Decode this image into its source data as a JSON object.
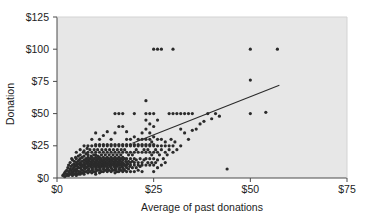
{
  "chart_data": {
    "type": "scatter",
    "title": "",
    "xlabel": "Average of past donations",
    "ylabel": "Donation",
    "xlim": [
      0,
      75
    ],
    "ylim": [
      0,
      125
    ],
    "xticks": [
      0,
      25,
      50,
      75
    ],
    "yticks": [
      0,
      25,
      50,
      75,
      100,
      125
    ],
    "xtick_labels": [
      "$0",
      "$25",
      "$50",
      "$75"
    ],
    "ytick_labels": [
      "$0",
      "$25",
      "$50",
      "$75",
      "$100",
      "$125"
    ],
    "grid": false,
    "legend": null,
    "marker_color": "#2b2b2b",
    "marker_size": 1.6,
    "plot_background": "#e7e7e7",
    "frame_color": "#4a4a4a",
    "trendline": {
      "label": "regression line",
      "color": "#2b2b2b",
      "x_start": 19.5,
      "y_start": 27.0,
      "x_end": 57.5,
      "y_end": 72.0
    },
    "points": [
      [
        1.5,
        2
      ],
      [
        1.8,
        3
      ],
      [
        2,
        1
      ],
      [
        2,
        4
      ],
      [
        2.2,
        5
      ],
      [
        2.5,
        2
      ],
      [
        2.5,
        6
      ],
      [
        2.6,
        3
      ],
      [
        2.8,
        8
      ],
      [
        3,
        2
      ],
      [
        3,
        5
      ],
      [
        3,
        10
      ],
      [
        3.2,
        4
      ],
      [
        3.3,
        7
      ],
      [
        3.4,
        12
      ],
      [
        3.5,
        3
      ],
      [
        3.5,
        6
      ],
      [
        3.6,
        9
      ],
      [
        3.8,
        5
      ],
      [
        3.8,
        15
      ],
      [
        4,
        2
      ],
      [
        4,
        4
      ],
      [
        4,
        7
      ],
      [
        4,
        10
      ],
      [
        4,
        14
      ],
      [
        4.2,
        5
      ],
      [
        4.3,
        8
      ],
      [
        4.4,
        11
      ],
      [
        4.5,
        3
      ],
      [
        4.5,
        6
      ],
      [
        4.5,
        13
      ],
      [
        4.6,
        9
      ],
      [
        4.8,
        5
      ],
      [
        4.8,
        16
      ],
      [
        5,
        2
      ],
      [
        5,
        4
      ],
      [
        5,
        7
      ],
      [
        5,
        10
      ],
      [
        5,
        12
      ],
      [
        5,
        15
      ],
      [
        5,
        20
      ],
      [
        5.2,
        6
      ],
      [
        5.3,
        9
      ],
      [
        5.4,
        13
      ],
      [
        5.5,
        3
      ],
      [
        5.5,
        8
      ],
      [
        5.5,
        11
      ],
      [
        5.5,
        17
      ],
      [
        5.6,
        5
      ],
      [
        5.8,
        14
      ],
      [
        6,
        3
      ],
      [
        6,
        5
      ],
      [
        6,
        8
      ],
      [
        6,
        10
      ],
      [
        6,
        12
      ],
      [
        6,
        15
      ],
      [
        6,
        18
      ],
      [
        6,
        22
      ],
      [
        6.2,
        7
      ],
      [
        6.3,
        11
      ],
      [
        6.4,
        9
      ],
      [
        6.5,
        4
      ],
      [
        6.5,
        13
      ],
      [
        6.5,
        16
      ],
      [
        6.6,
        6
      ],
      [
        6.8,
        10
      ],
      [
        6.8,
        20
      ],
      [
        7,
        3
      ],
      [
        7,
        5
      ],
      [
        7,
        8
      ],
      [
        7,
        10
      ],
      [
        7,
        12
      ],
      [
        7,
        14
      ],
      [
        7,
        17
      ],
      [
        7,
        21
      ],
      [
        7,
        25
      ],
      [
        7.2,
        7
      ],
      [
        7.3,
        9
      ],
      [
        7.4,
        11
      ],
      [
        7.5,
        5
      ],
      [
        7.5,
        13
      ],
      [
        7.5,
        15
      ],
      [
        7.5,
        19
      ],
      [
        7.6,
        8
      ],
      [
        7.8,
        12
      ],
      [
        7.8,
        23
      ],
      [
        8,
        4
      ],
      [
        8,
        6
      ],
      [
        8,
        9
      ],
      [
        8,
        10
      ],
      [
        8,
        12
      ],
      [
        8,
        14
      ],
      [
        8,
        16
      ],
      [
        8,
        18
      ],
      [
        8,
        20
      ],
      [
        8,
        25
      ],
      [
        8.2,
        7
      ],
      [
        8.3,
        11
      ],
      [
        8.4,
        13
      ],
      [
        8.5,
        5
      ],
      [
        8.5,
        10
      ],
      [
        8.5,
        15
      ],
      [
        8.5,
        22
      ],
      [
        8.6,
        9
      ],
      [
        8.8,
        12
      ],
      [
        8.8,
        17
      ],
      [
        9,
        4
      ],
      [
        9,
        6
      ],
      [
        9,
        8
      ],
      [
        9,
        10
      ],
      [
        9,
        12
      ],
      [
        9,
        14
      ],
      [
        9,
        16
      ],
      [
        9,
        20
      ],
      [
        9,
        25
      ],
      [
        9,
        30
      ],
      [
        9.2,
        7
      ],
      [
        9.3,
        11
      ],
      [
        9.4,
        13
      ],
      [
        9.5,
        5
      ],
      [
        9.5,
        9
      ],
      [
        9.5,
        15
      ],
      [
        9.5,
        18
      ],
      [
        9.6,
        22
      ],
      [
        9.8,
        10
      ],
      [
        9.8,
        12
      ],
      [
        10,
        3
      ],
      [
        10,
        5
      ],
      [
        10,
        7
      ],
      [
        10,
        9
      ],
      [
        10,
        10
      ],
      [
        10,
        12
      ],
      [
        10,
        14
      ],
      [
        10,
        16
      ],
      [
        10,
        18
      ],
      [
        10,
        20
      ],
      [
        10,
        25
      ],
      [
        10,
        26
      ],
      [
        10,
        35
      ],
      [
        10.2,
        8
      ],
      [
        10.3,
        11
      ],
      [
        10.4,
        13
      ],
      [
        10.5,
        6
      ],
      [
        10.5,
        10
      ],
      [
        10.5,
        15
      ],
      [
        10.5,
        22
      ],
      [
        10.6,
        17
      ],
      [
        10.8,
        9
      ],
      [
        10.8,
        12
      ],
      [
        11,
        4
      ],
      [
        11,
        6
      ],
      [
        11,
        8
      ],
      [
        11,
        10
      ],
      [
        11,
        12
      ],
      [
        11,
        14
      ],
      [
        11,
        16
      ],
      [
        11,
        20
      ],
      [
        11,
        25
      ],
      [
        11,
        26
      ],
      [
        11,
        30
      ],
      [
        11.2,
        7
      ],
      [
        11.3,
        11
      ],
      [
        11.4,
        15
      ],
      [
        11.5,
        5
      ],
      [
        11.5,
        9
      ],
      [
        11.5,
        13
      ],
      [
        11.5,
        18
      ],
      [
        11.6,
        22
      ],
      [
        11.8,
        10
      ],
      [
        11.8,
        12
      ],
      [
        12,
        5
      ],
      [
        12,
        7
      ],
      [
        12,
        9
      ],
      [
        12,
        10
      ],
      [
        12,
        12
      ],
      [
        12,
        14
      ],
      [
        12,
        16
      ],
      [
        12,
        20
      ],
      [
        12,
        25
      ],
      [
        12,
        26
      ],
      [
        12,
        33
      ],
      [
        12.2,
        8
      ],
      [
        12.3,
        11
      ],
      [
        12.4,
        13
      ],
      [
        12.5,
        6
      ],
      [
        12.5,
        10
      ],
      [
        12.5,
        15
      ],
      [
        12.5,
        18
      ],
      [
        12.6,
        22
      ],
      [
        12.8,
        9
      ],
      [
        12.8,
        12
      ],
      [
        13,
        5
      ],
      [
        13,
        7
      ],
      [
        13,
        10
      ],
      [
        13,
        12
      ],
      [
        13,
        14
      ],
      [
        13,
        16
      ],
      [
        13,
        20
      ],
      [
        13,
        25
      ],
      [
        13,
        26
      ],
      [
        13,
        36
      ],
      [
        13.2,
        8
      ],
      [
        13.3,
        11
      ],
      [
        13.4,
        15
      ],
      [
        13.5,
        6
      ],
      [
        13.5,
        10
      ],
      [
        13.5,
        13
      ],
      [
        13.5,
        18
      ],
      [
        13.6,
        22
      ],
      [
        13.8,
        9
      ],
      [
        13.8,
        12
      ],
      [
        14,
        5
      ],
      [
        14,
        8
      ],
      [
        14,
        10
      ],
      [
        14,
        12
      ],
      [
        14,
        14
      ],
      [
        14,
        16
      ],
      [
        14,
        20
      ],
      [
        14,
        25
      ],
      [
        14,
        26
      ],
      [
        14,
        30
      ],
      [
        14.2,
        7
      ],
      [
        14.3,
        11
      ],
      [
        14.4,
        13
      ],
      [
        14.5,
        6
      ],
      [
        14.5,
        10
      ],
      [
        14.5,
        15
      ],
      [
        14.5,
        18
      ],
      [
        14.6,
        22
      ],
      [
        14.8,
        9
      ],
      [
        14.8,
        12
      ],
      [
        15,
        4
      ],
      [
        15,
        6
      ],
      [
        15,
        8
      ],
      [
        15,
        10
      ],
      [
        15,
        12
      ],
      [
        15,
        14
      ],
      [
        15,
        16
      ],
      [
        15,
        20
      ],
      [
        15,
        25
      ],
      [
        15,
        26
      ],
      [
        15,
        35
      ],
      [
        15,
        50
      ],
      [
        15.2,
        7
      ],
      [
        15.3,
        11
      ],
      [
        15.4,
        13
      ],
      [
        15.5,
        5
      ],
      [
        15.5,
        9
      ],
      [
        15.5,
        15
      ],
      [
        15.5,
        18
      ],
      [
        15.6,
        22
      ],
      [
        15.8,
        10
      ],
      [
        15.8,
        12
      ],
      [
        16,
        5
      ],
      [
        16,
        7
      ],
      [
        16,
        10
      ],
      [
        16,
        12
      ],
      [
        16,
        14
      ],
      [
        16,
        16
      ],
      [
        16,
        20
      ],
      [
        16,
        25
      ],
      [
        16,
        26
      ],
      [
        16,
        40
      ],
      [
        16,
        50
      ],
      [
        16.2,
        8
      ],
      [
        16.3,
        11
      ],
      [
        16.4,
        13
      ],
      [
        16.5,
        6
      ],
      [
        16.5,
        10
      ],
      [
        16.5,
        15
      ],
      [
        16.5,
        18
      ],
      [
        16.6,
        22
      ],
      [
        16.8,
        9
      ],
      [
        16.8,
        12
      ],
      [
        17,
        5
      ],
      [
        17,
        8
      ],
      [
        17,
        10
      ],
      [
        17,
        12
      ],
      [
        17,
        14
      ],
      [
        17,
        16
      ],
      [
        17,
        20
      ],
      [
        17,
        25
      ],
      [
        17,
        26
      ],
      [
        17,
        40
      ],
      [
        17,
        50
      ],
      [
        17.2,
        7
      ],
      [
        17.3,
        11
      ],
      [
        17.5,
        6
      ],
      [
        17.5,
        10
      ],
      [
        17.5,
        15
      ],
      [
        17.5,
        22
      ],
      [
        17.8,
        9
      ],
      [
        17.8,
        13
      ],
      [
        18,
        5
      ],
      [
        18,
        8
      ],
      [
        18,
        10
      ],
      [
        18,
        12
      ],
      [
        18,
        15
      ],
      [
        18,
        20
      ],
      [
        18,
        25
      ],
      [
        18,
        26
      ],
      [
        18,
        30
      ],
      [
        18,
        36
      ],
      [
        18.3,
        11
      ],
      [
        18.5,
        7
      ],
      [
        18.5,
        13
      ],
      [
        18.5,
        18
      ],
      [
        18.8,
        9
      ],
      [
        19,
        5
      ],
      [
        19,
        10
      ],
      [
        19,
        12
      ],
      [
        19,
        15
      ],
      [
        19,
        20
      ],
      [
        19,
        25
      ],
      [
        19,
        26
      ],
      [
        19,
        30
      ],
      [
        19.5,
        8
      ],
      [
        19.5,
        13
      ],
      [
        19.5,
        18
      ],
      [
        20,
        5
      ],
      [
        20,
        10
      ],
      [
        20,
        12
      ],
      [
        20,
        15
      ],
      [
        20,
        20
      ],
      [
        20,
        25
      ],
      [
        20,
        26
      ],
      [
        20,
        32
      ],
      [
        20,
        50
      ],
      [
        20.5,
        8
      ],
      [
        20.5,
        14
      ],
      [
        20.5,
        22
      ],
      [
        21,
        6
      ],
      [
        21,
        10
      ],
      [
        21,
        12
      ],
      [
        21,
        20
      ],
      [
        21,
        25
      ],
      [
        21,
        26
      ],
      [
        21,
        30
      ],
      [
        21.5,
        9
      ],
      [
        21.5,
        15
      ],
      [
        22,
        5
      ],
      [
        22,
        10
      ],
      [
        22,
        12
      ],
      [
        22,
        20
      ],
      [
        22,
        25
      ],
      [
        22,
        26
      ],
      [
        22,
        30
      ],
      [
        22,
        35
      ],
      [
        22.5,
        14
      ],
      [
        22.5,
        22
      ],
      [
        23,
        10
      ],
      [
        23,
        15
      ],
      [
        23,
        20
      ],
      [
        23,
        25
      ],
      [
        23,
        26
      ],
      [
        23,
        30
      ],
      [
        23,
        38
      ],
      [
        23,
        45
      ],
      [
        23,
        50
      ],
      [
        23,
        60
      ],
      [
        23.5,
        12
      ],
      [
        23.5,
        22
      ],
      [
        24,
        10
      ],
      [
        24,
        15
      ],
      [
        24,
        20
      ],
      [
        24,
        25
      ],
      [
        24,
        26
      ],
      [
        24,
        30
      ],
      [
        24,
        35
      ],
      [
        24,
        42
      ],
      [
        24,
        50
      ],
      [
        24.5,
        12
      ],
      [
        24.5,
        18
      ],
      [
        24.5,
        28
      ],
      [
        25,
        5
      ],
      [
        25,
        10
      ],
      [
        25,
        15
      ],
      [
        25,
        20
      ],
      [
        25,
        25
      ],
      [
        25,
        26
      ],
      [
        25,
        32
      ],
      [
        25,
        40
      ],
      [
        25,
        50
      ],
      [
        25,
        100
      ],
      [
        25.5,
        12
      ],
      [
        25.5,
        22
      ],
      [
        26,
        8
      ],
      [
        26,
        14
      ],
      [
        26,
        20
      ],
      [
        26,
        25
      ],
      [
        26,
        30
      ],
      [
        26,
        45
      ],
      [
        26,
        100
      ],
      [
        26.5,
        18
      ],
      [
        27,
        10
      ],
      [
        27,
        22
      ],
      [
        27,
        25
      ],
      [
        27,
        30
      ],
      [
        27,
        100
      ],
      [
        27.5,
        15
      ],
      [
        28,
        12
      ],
      [
        28,
        20
      ],
      [
        28,
        25
      ],
      [
        28,
        28
      ],
      [
        28.5,
        18
      ],
      [
        29,
        22
      ],
      [
        29,
        25
      ],
      [
        29,
        50
      ],
      [
        29.5,
        30
      ],
      [
        30,
        20
      ],
      [
        30,
        25
      ],
      [
        30,
        50
      ],
      [
        30,
        100
      ],
      [
        30.5,
        28
      ],
      [
        31,
        22
      ],
      [
        31,
        50
      ],
      [
        32,
        25
      ],
      [
        32,
        50
      ],
      [
        32,
        38
      ],
      [
        33,
        35
      ],
      [
        33,
        50
      ],
      [
        34,
        30
      ],
      [
        34,
        50
      ],
      [
        35,
        37
      ],
      [
        35,
        50
      ],
      [
        36,
        38
      ],
      [
        37,
        42
      ],
      [
        38,
        44
      ],
      [
        39,
        50
      ],
      [
        40,
        46
      ],
      [
        41,
        50
      ],
      [
        42,
        48
      ],
      [
        44,
        7
      ],
      [
        50,
        50
      ],
      [
        50,
        76
      ],
      [
        50,
        100
      ],
      [
        54,
        51
      ],
      [
        57,
        100
      ]
    ]
  }
}
